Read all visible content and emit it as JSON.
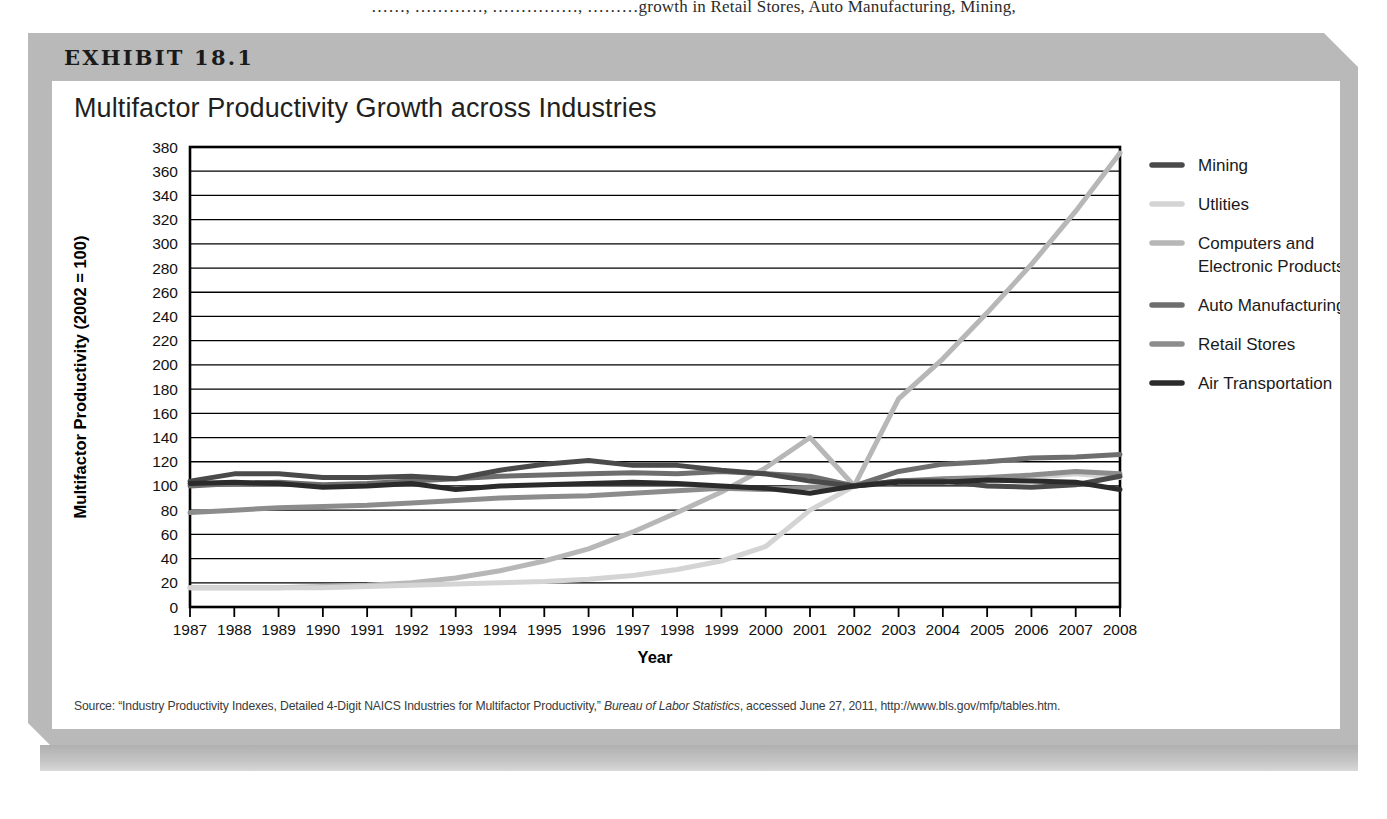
{
  "page_top_text": "……,  …………,  ……………,  ………growth in Retail Stores, Auto Manufacturing, Mining,",
  "exhibit": {
    "label": "EXHIBIT 18.1",
    "title": "Multifactor Productivity Growth across Industries",
    "source_prefix": "Source: “Industry Productivity Indexes, Detailed 4-Digit NAICS Industries for Multifactor Productivity,” ",
    "source_italic": "Bureau of Labor Statistics",
    "source_suffix": ", accessed June 27, 2011, http://www.bls.gov/mfp/tables.htm."
  },
  "colors": {
    "mining": "#4a4a4a",
    "utilities": "#d4d4d4",
    "computers": "#b7b7b7",
    "auto": "#6e6e6e",
    "retail": "#8c8c8c",
    "air": "#2b2b2b",
    "axis": "#000000",
    "grid": "#000000",
    "header_band": "#b9b9b9"
  },
  "chart_data": {
    "type": "line",
    "title": "Multifactor Productivity Growth across Industries",
    "xlabel": "Year",
    "ylabel": "Multifactor Productivity (2002 = 100)",
    "ylim": [
      0,
      380
    ],
    "ytick_step": 20,
    "yticks": [
      0,
      20,
      40,
      60,
      80,
      100,
      120,
      140,
      160,
      180,
      200,
      220,
      240,
      260,
      280,
      300,
      320,
      340,
      360,
      380
    ],
    "grid": true,
    "legend_position": "right",
    "x": [
      1987,
      1988,
      1989,
      1990,
      1991,
      1992,
      1993,
      1994,
      1995,
      1996,
      1997,
      1998,
      1999,
      2000,
      2001,
      2002,
      2003,
      2004,
      2005,
      2006,
      2007,
      2008
    ],
    "categories": [
      "1987",
      "1988",
      "1989",
      "1990",
      "1991",
      "1992",
      "1993",
      "1994",
      "1995",
      "1996",
      "1997",
      "1998",
      "1999",
      "2000",
      "2001",
      "2002",
      "2003",
      "2004",
      "2005",
      "2006",
      "2007",
      "2008"
    ],
    "series": [
      {
        "name": "Mining",
        "color": "#4a4a4a",
        "values": [
          104,
          110,
          110,
          107,
          107,
          108,
          106,
          113,
          118,
          121,
          117,
          117,
          113,
          110,
          104,
          100,
          104,
          104,
          100,
          99,
          101,
          108
        ]
      },
      {
        "name": "Utlities",
        "color": "#d4d4d4",
        "values": [
          16,
          16,
          16,
          16,
          17,
          18,
          19,
          20,
          21,
          23,
          26,
          31,
          38,
          50,
          80,
          100,
          103,
          104,
          103,
          107,
          110,
          107
        ]
      },
      {
        "name": "Computers and Electronic Products",
        "color": "#b7b7b7",
        "values": [
          16,
          16,
          16,
          17,
          18,
          20,
          24,
          30,
          38,
          48,
          62,
          78,
          95,
          115,
          140,
          100,
          172,
          205,
          243,
          283,
          327,
          375
        ]
      },
      {
        "name": "Auto Manufacturing",
        "color": "#6e6e6e",
        "values": [
          100,
          102,
          103,
          101,
          102,
          104,
          106,
          108,
          109,
          110,
          111,
          110,
          112,
          110,
          108,
          100,
          112,
          118,
          120,
          123,
          124,
          126
        ]
      },
      {
        "name": "Retail Stores",
        "color": "#8c8c8c",
        "values": [
          78,
          80,
          82,
          83,
          84,
          86,
          88,
          90,
          91,
          92,
          94,
          96,
          98,
          97,
          99,
          100,
          104,
          106,
          107,
          109,
          112,
          110
        ]
      },
      {
        "name": "Air Transportation",
        "color": "#2b2b2b",
        "values": [
          102,
          103,
          102,
          99,
          100,
          102,
          97,
          100,
          101,
          102,
          103,
          102,
          100,
          98,
          94,
          100,
          103,
          103,
          105,
          104,
          103,
          97
        ]
      }
    ]
  },
  "legend": {
    "items": [
      {
        "label": "Mining",
        "color": "#4a4a4a"
      },
      {
        "label": "Utlities",
        "color": "#d4d4d4"
      },
      {
        "label": "Computers and",
        "label2": "Electronic Products",
        "color": "#b7b7b7"
      },
      {
        "label": "Auto Manufacturing",
        "color": "#6e6e6e"
      },
      {
        "label": "Retail Stores",
        "color": "#8c8c8c"
      },
      {
        "label": "Air Transportation",
        "color": "#2b2b2b"
      }
    ]
  }
}
